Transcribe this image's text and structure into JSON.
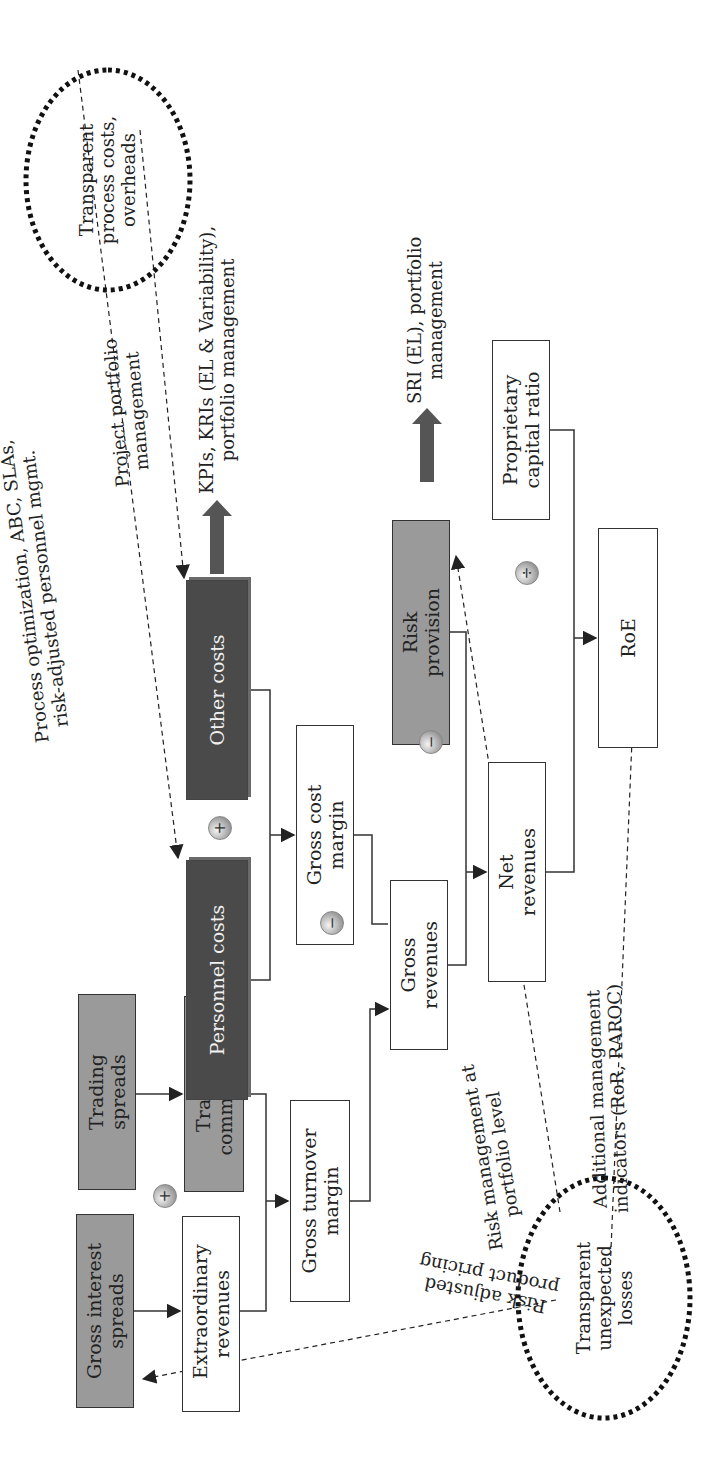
{
  "diagram": {
    "title": "",
    "orientation": "rotated-90-ccw",
    "nodes": {
      "gross_interest_spreads": "Gross interest spreads",
      "trading_spreads": "Trading spreads",
      "extraordinary_revenues": "Extraordinary revenues",
      "trading_commissions": "Trading commissions",
      "gross_turnover_margin": "Gross turnover margin",
      "gross_revenues": "Gross revenues",
      "personnel_costs": "Personnel costs",
      "other_costs": "Other costs",
      "gross_cost_margin": "Gross cost margin",
      "risk_provision": "Risk provision",
      "net_revenues": "Net revenues",
      "roe": "RoE",
      "proprietary_capital_ratio": "Proprietary capital ratio"
    },
    "operators": {
      "plus_revenues": "+",
      "plus_costs": "+",
      "minus_costs": "−",
      "minus_risk": "−",
      "divide": "÷"
    },
    "ellipses": {
      "top": "Transparent process costs, overheads",
      "bottom": "Transparent unexpected losses"
    },
    "annotations": {
      "process_optimization": "Process optimization, ABC, SLAs,",
      "risk_adjusted_personnel": "risk-adjusted personnel mgmt.",
      "project_portfolio": "Project portfolio",
      "project_portfolio_2": "management",
      "kpis": "KPIs, KRIs (EL & Variability),",
      "kpis_2": "portfolio management",
      "sri": "SRI (EL), portfolio",
      "sri_2": "management",
      "risk_mgmt_portfolio": "Risk management at",
      "risk_mgmt_portfolio_2": "portfolio level",
      "additional_indicators": "Additional management",
      "additional_indicators_2": "indicators (RoR, RAROC)",
      "risk_adjusted_pricing": "Risk adjusted",
      "risk_adjusted_pricing_2": "product pricing"
    },
    "colors": {
      "light_box": "#9a9a9a",
      "dark_box": "#4a4a4a",
      "line": "#333333"
    }
  }
}
